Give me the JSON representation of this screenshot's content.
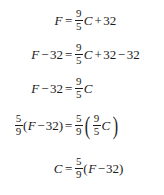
{
  "document": {
    "kind": "math-derivation",
    "background_color": "#ffffff",
    "text_color": "#1b1b1b",
    "description": "Algebraic derivation solving the Fahrenheit formula for C"
  },
  "symbols": {
    "equals": "=",
    "plus": "+",
    "minus": "−",
    "paren_open": "(",
    "paren_close": ")"
  },
  "equations": [
    {
      "id": "eq-1",
      "plain": "F = 9/5 C + 32",
      "lhs": {
        "variable": "F"
      },
      "relation": "=",
      "rhs": {
        "fraction": {
          "numerator": "9",
          "denominator": "5"
        },
        "variable": "C",
        "operator": "+",
        "term": "32"
      }
    },
    {
      "id": "eq-2",
      "plain": "F - 32 = 9/5 C + 32 - 32",
      "lhs": {
        "variable": "F",
        "operator": "−",
        "term": "32"
      },
      "relation": "=",
      "rhs": {
        "fraction": {
          "numerator": "9",
          "denominator": "5"
        },
        "variable": "C",
        "operator1": "+",
        "term1": "32",
        "operator2": "−",
        "term2": "32"
      }
    },
    {
      "id": "eq-3",
      "plain": "F - 32 = 9/5 C",
      "lhs": {
        "variable": "F",
        "operator": "−",
        "term": "32"
      },
      "relation": "=",
      "rhs": {
        "fraction": {
          "numerator": "9",
          "denominator": "5"
        },
        "variable": "C"
      }
    },
    {
      "id": "eq-4",
      "plain": "5/9 (F - 32) = 5/9 ( 9/5 C )",
      "lhs": {
        "fraction": {
          "numerator": "5",
          "denominator": "9"
        },
        "paren_open": "(",
        "variable": "F",
        "operator": "−",
        "term": "32",
        "paren_close": ")"
      },
      "relation": "=",
      "rhs": {
        "fraction": {
          "numerator": "5",
          "denominator": "9"
        },
        "paren_open": "(",
        "inner_fraction": {
          "numerator": "9",
          "denominator": "5"
        },
        "variable": "C",
        "paren_close": ")"
      }
    },
    {
      "id": "eq-5",
      "plain": "C = 5/9 (F - 32)",
      "lhs": {
        "variable": "C"
      },
      "relation": "=",
      "rhs": {
        "fraction": {
          "numerator": "5",
          "denominator": "9"
        },
        "paren_open": "(",
        "variable": "F",
        "operator": "−",
        "term": "32",
        "paren_close": ")"
      }
    }
  ]
}
